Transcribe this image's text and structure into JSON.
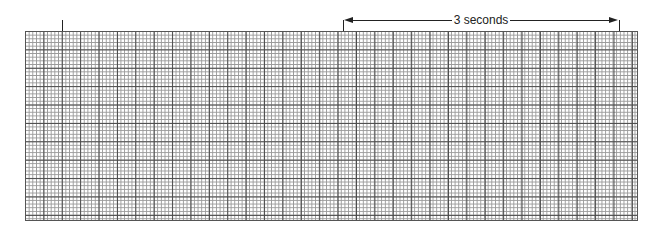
{
  "strip": {
    "type": "ecg-rhythm-strip-grid",
    "major_box_px": 18.4,
    "minor_boxes_per_major": 5,
    "major_line_color": "#4a4a4a",
    "minor_line_color": "#9a9a9a"
  },
  "markers": {
    "left_tick_label": "",
    "interval_label": "3 seconds"
  }
}
